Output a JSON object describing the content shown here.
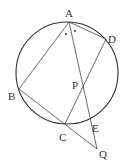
{
  "diagram": {
    "type": "geometry",
    "circle": {
      "cx": 67,
      "cy": 73,
      "r": 51
    },
    "points": {
      "A": {
        "x": 69,
        "y": 22,
        "label": "A"
      },
      "B": {
        "x": 19,
        "y": 89,
        "label": "B"
      },
      "C": {
        "x": 65,
        "y": 124,
        "label": "C"
      },
      "D": {
        "x": 106,
        "y": 39,
        "label": "D"
      },
      "E": {
        "x": 91,
        "y": 117,
        "label": "E"
      },
      "P": {
        "x": 82,
        "y": 87,
        "label": "P"
      },
      "Q": {
        "x": 97,
        "y": 149,
        "label": "Q"
      }
    },
    "segments": [
      "AB",
      "AD",
      "AQ",
      "BQ",
      "CD"
    ],
    "angle_marks": {
      "description": "equal angles BAE and EAD marked with dots",
      "count": 2
    },
    "colors": {
      "stroke": "#333333",
      "background": "#ffffff"
    }
  }
}
